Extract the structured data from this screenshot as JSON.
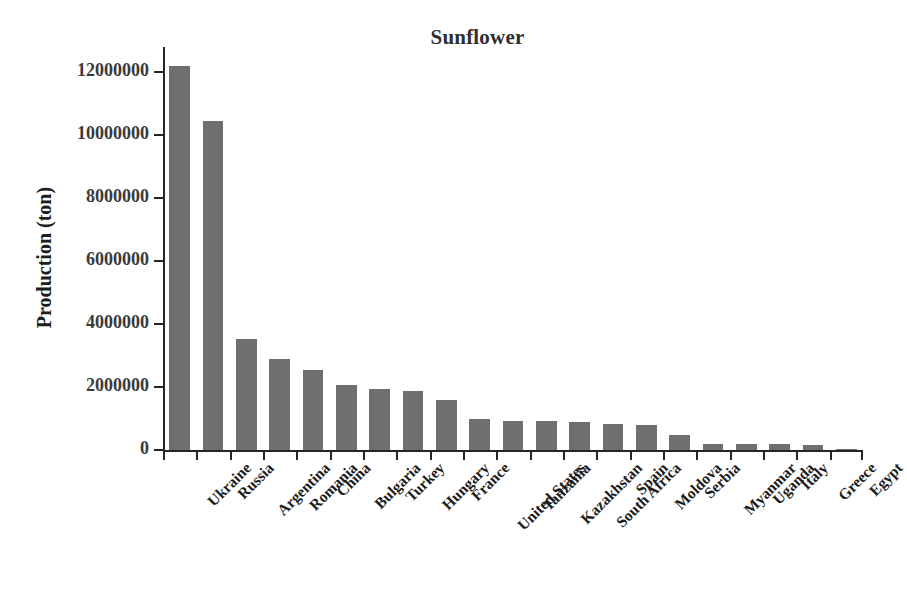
{
  "chart_data": {
    "type": "bar",
    "title": "Sunflower",
    "xlabel": "",
    "ylabel": "Production (ton)",
    "ylim": [
      0,
      12800000
    ],
    "yticks": [
      0,
      2000000,
      4000000,
      6000000,
      8000000,
      10000000,
      12000000
    ],
    "ytick_labels": [
      "0",
      "2000000",
      "4000000",
      "6000000",
      "8000000",
      "10000000",
      "12000000"
    ],
    "grid": false,
    "legend": null,
    "bar_color": "#6f6f6f",
    "categories": [
      "Ukraine",
      "Russia",
      "Argentina",
      "Romania",
      "China",
      "Bulgaria",
      "Turkey",
      "Hungary",
      "France",
      "United States",
      "Tanzania",
      "Kazakhstan",
      "South Africa",
      "Spain",
      "Moldova",
      "Serbia",
      "Myanmar",
      "Uganda",
      "Italy",
      "Greece",
      "Egypt"
    ],
    "values": [
      12200000,
      10450000,
      3520000,
      2900000,
      2550000,
      2050000,
      1950000,
      1870000,
      1600000,
      1000000,
      930000,
      910000,
      880000,
      830000,
      790000,
      490000,
      190000,
      185000,
      180000,
      165000,
      20000
    ]
  },
  "figure": {
    "background": "#ffffff",
    "axis_color": "#262626",
    "text_color": "#1c1c1c"
  }
}
